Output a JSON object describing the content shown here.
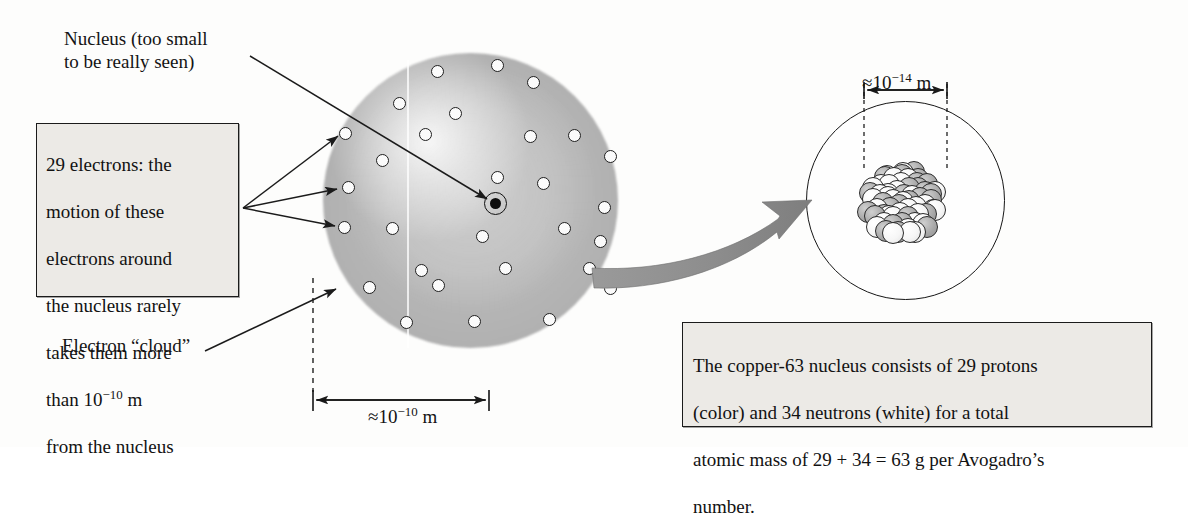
{
  "figure": {
    "type": "scientific-diagram"
  },
  "labels": {
    "nucleus_callout": "Nucleus (too small\nto be really seen)",
    "electron_cloud_callout": "Electron “cloud”",
    "atom_scale": "≈10",
    "atom_scale_exp": "−10",
    "atom_scale_unit": " m",
    "nucleus_scale": "≈10",
    "nucleus_scale_exp": "−14",
    "nucleus_scale_unit": " m"
  },
  "boxes": {
    "electrons": {
      "line1": "29 electrons: the",
      "line2": "motion of these",
      "line3": "electrons around",
      "line4": "the nucleus rarely",
      "line5": "takes them more",
      "line6_pre": "than 10",
      "line6_exp": "−10",
      "line6_post": " m",
      "line7": "from the nucleus"
    },
    "caption": {
      "line1": "The copper-63 nucleus consists of 29 protons",
      "line2": "(color) and 34 neutrons (white) for a total",
      "line3": "atomic mass of 29 + 34 = 63 g per Avogadro’s",
      "line4": "number."
    }
  },
  "colors": {
    "cloud_gray": "#b4b4b4",
    "proton_gray": "#a9a9a9",
    "neutron_white": "#ffffff",
    "ink": "#141414",
    "box_fill": "#eceae6",
    "arrow_gray": "#8c8c8c"
  },
  "chart_data": {
    "type": "scatter",
    "atom": {
      "center": [
        470,
        200
      ],
      "radius": 147,
      "electron_count": 29,
      "electron_positions": [
        [
          437,
          71
        ],
        [
          497,
          65
        ],
        [
          533,
          82
        ],
        [
          399,
          103
        ],
        [
          455,
          113
        ],
        [
          345,
          133
        ],
        [
          425,
          134
        ],
        [
          530,
          136
        ],
        [
          574,
          135
        ],
        [
          610,
          156
        ],
        [
          382,
          160
        ],
        [
          348,
          187
        ],
        [
          497,
          177
        ],
        [
          543,
          183
        ],
        [
          604,
          207
        ],
        [
          344,
          227
        ],
        [
          392,
          228
        ],
        [
          482,
          236
        ],
        [
          564,
          228
        ],
        [
          600,
          241
        ],
        [
          421,
          270
        ],
        [
          505,
          268
        ],
        [
          589,
          268
        ],
        [
          369,
          287
        ],
        [
          438,
          285
        ],
        [
          610,
          288
        ],
        [
          406,
          322
        ],
        [
          474,
          321
        ],
        [
          549,
          319
        ]
      ],
      "nucleus_marker": [
        495,
        203
      ]
    },
    "magnified_nucleus": {
      "circle_center": [
        905,
        200
      ],
      "circle_radius": 99,
      "cluster_center": [
        903,
        202
      ],
      "protons": 29,
      "neutrons": 34,
      "total_nucleons": 63
    },
    "dimensions": [
      {
        "label": "≈10⁻¹⁰ m",
        "from_x": 313,
        "to_x": 489,
        "y": 400
      },
      {
        "label": "≈10⁻¹⁴ m",
        "from_x": 864,
        "to_x": 947,
        "y": 90
      }
    ]
  }
}
